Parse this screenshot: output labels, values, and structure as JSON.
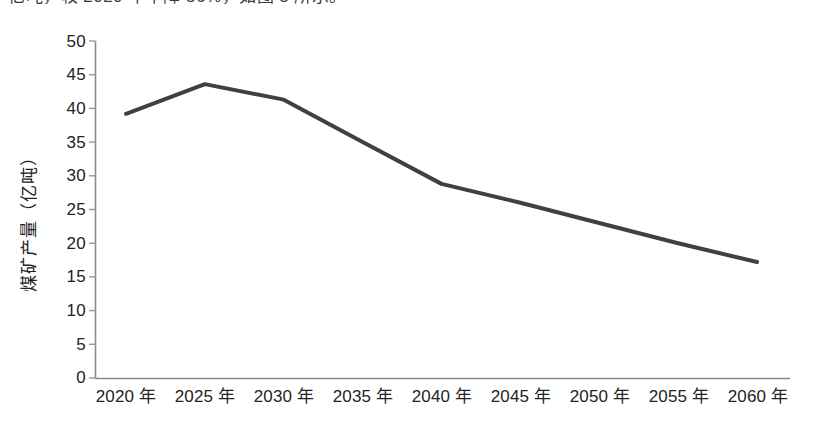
{
  "caption": {
    "text": "亿吨，较 2020 年下降 56%，如图 5 所示。"
  },
  "chart_data": {
    "type": "line",
    "title": "",
    "subtitle": "",
    "xlabel": "",
    "ylabel": "煤矿产量（亿吨）",
    "categories": [
      "2020 年",
      "2025 年",
      "2030 年",
      "2035 年",
      "2040 年",
      "2045 年",
      "2050 年",
      "2055 年",
      "2060 年"
    ],
    "x_values": [
      2020,
      2025,
      2030,
      2035,
      2040,
      2045,
      2050,
      2055,
      2060
    ],
    "series": [
      {
        "name": "煤矿产量",
        "values": [
          39.2,
          43.6,
          41.3,
          35.0,
          28.8,
          26.0,
          23.0,
          20.0,
          17.2
        ],
        "color": "#404040"
      }
    ],
    "ylim": [
      0,
      50
    ],
    "yticks": [
      0,
      5,
      10,
      15,
      20,
      25,
      30,
      35,
      40,
      45,
      50
    ],
    "ytick_labels": [
      "0",
      "5",
      "10",
      "15",
      "20",
      "25",
      "30",
      "35",
      "40",
      "45",
      "50"
    ],
    "grid": false,
    "legend": "none",
    "markers": false,
    "line_width": 4,
    "axis_color": "#808080",
    "tick_color": "#909090"
  }
}
